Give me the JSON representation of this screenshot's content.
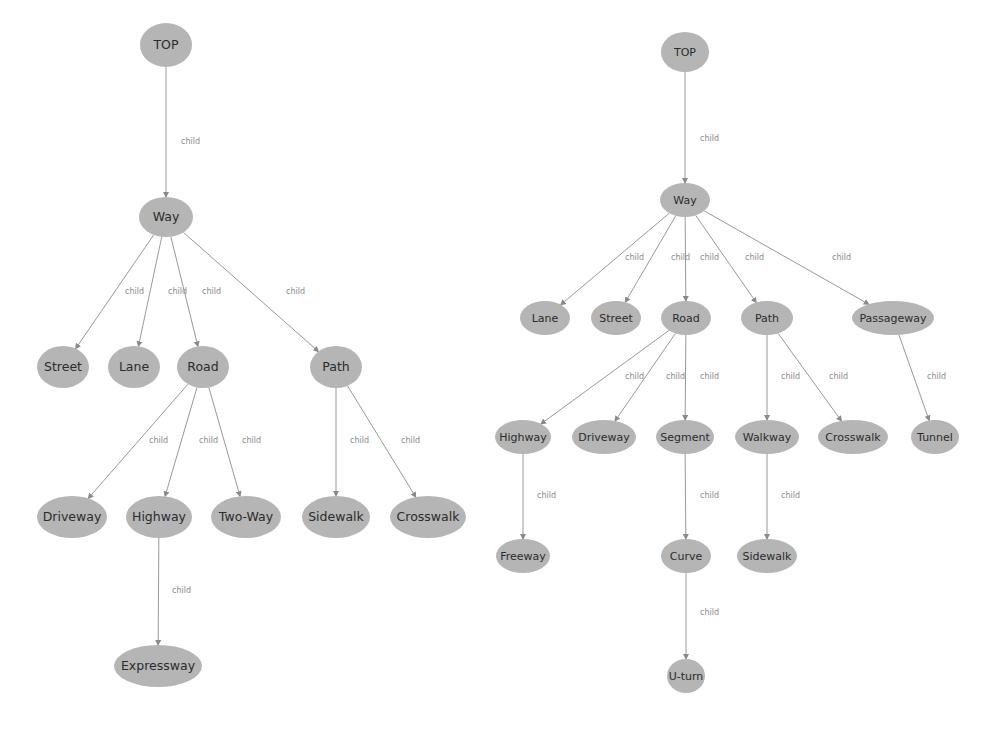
{
  "figure": {
    "type": "two-taxonomy-trees",
    "edge_label": "child",
    "node_fill": "#b5b5b5",
    "edge_color": "#9a9a9a",
    "text_color": "#2b2b2b",
    "edge_label_color": "#8a8a8a"
  },
  "left_tree": {
    "nodes": [
      {
        "id": "L_TOP",
        "label": "TOP",
        "x": 166,
        "y": 45,
        "rx": 26,
        "ry": 22
      },
      {
        "id": "L_Way",
        "label": "Way",
        "x": 166,
        "y": 217,
        "rx": 27,
        "ry": 20
      },
      {
        "id": "L_Street",
        "label": "Street",
        "x": 63,
        "y": 367,
        "rx": 26,
        "ry": 21
      },
      {
        "id": "L_Lane",
        "label": "Lane",
        "x": 134,
        "y": 367,
        "rx": 26,
        "ry": 21
      },
      {
        "id": "L_Road",
        "label": "Road",
        "x": 203,
        "y": 367,
        "rx": 26,
        "ry": 21
      },
      {
        "id": "L_Path",
        "label": "Path",
        "x": 336,
        "y": 367,
        "rx": 26,
        "ry": 21
      },
      {
        "id": "L_Driveway",
        "label": "Driveway",
        "x": 72,
        "y": 517,
        "rx": 35,
        "ry": 21
      },
      {
        "id": "L_Highway",
        "label": "Highway",
        "x": 159,
        "y": 517,
        "rx": 33,
        "ry": 21
      },
      {
        "id": "L_TwoWay",
        "label": "Two-Way",
        "x": 246,
        "y": 517,
        "rx": 35,
        "ry": 21
      },
      {
        "id": "L_Sidewalk",
        "label": "Sidewalk",
        "x": 336,
        "y": 517,
        "rx": 34,
        "ry": 21
      },
      {
        "id": "L_Crosswalk",
        "label": "Crosswalk",
        "x": 428,
        "y": 517,
        "rx": 38,
        "ry": 21
      },
      {
        "id": "L_Expressway",
        "label": "Expressway",
        "x": 158,
        "y": 666,
        "rx": 44,
        "ry": 21
      }
    ],
    "edges": [
      {
        "from": "L_TOP",
        "to": "L_Way",
        "label": "child",
        "lx": 181,
        "ly": 144
      },
      {
        "from": "L_Way",
        "to": "L_Street",
        "label": "child",
        "lx": 125,
        "ly": 294
      },
      {
        "from": "L_Way",
        "to": "L_Lane",
        "label": "child",
        "lx": 168,
        "ly": 294
      },
      {
        "from": "L_Way",
        "to": "L_Road",
        "label": "child",
        "lx": 202,
        "ly": 294
      },
      {
        "from": "L_Way",
        "to": "L_Path",
        "label": "child",
        "lx": 286,
        "ly": 294
      },
      {
        "from": "L_Road",
        "to": "L_Driveway",
        "label": "child",
        "lx": 149,
        "ly": 443
      },
      {
        "from": "L_Road",
        "to": "L_Highway",
        "label": "child",
        "lx": 199,
        "ly": 443
      },
      {
        "from": "L_Road",
        "to": "L_TwoWay",
        "label": "child",
        "lx": 242,
        "ly": 443
      },
      {
        "from": "L_Path",
        "to": "L_Sidewalk",
        "label": "child",
        "lx": 350,
        "ly": 443
      },
      {
        "from": "L_Path",
        "to": "L_Crosswalk",
        "label": "child",
        "lx": 401,
        "ly": 443
      },
      {
        "from": "L_Highway",
        "to": "L_Expressway",
        "label": "child",
        "lx": 172,
        "ly": 593
      }
    ]
  },
  "right_tree": {
    "nodes": [
      {
        "id": "R_TOP",
        "label": "TOP",
        "x": 685,
        "y": 52,
        "rx": 24,
        "ry": 20
      },
      {
        "id": "R_Way",
        "label": "Way",
        "x": 685,
        "y": 200,
        "rx": 25,
        "ry": 17
      },
      {
        "id": "R_Lane",
        "label": "Lane",
        "x": 545,
        "y": 318,
        "rx": 25,
        "ry": 17
      },
      {
        "id": "R_Street",
        "label": "Street",
        "x": 616,
        "y": 318,
        "rx": 25,
        "ry": 17
      },
      {
        "id": "R_Road",
        "label": "Road",
        "x": 686,
        "y": 318,
        "rx": 25,
        "ry": 17
      },
      {
        "id": "R_Path",
        "label": "Path",
        "x": 767,
        "y": 318,
        "rx": 26,
        "ry": 17
      },
      {
        "id": "R_Passageway",
        "label": "Passageway",
        "x": 893,
        "y": 318,
        "rx": 41,
        "ry": 17
      },
      {
        "id": "R_Highway",
        "label": "Highway",
        "x": 523,
        "y": 437,
        "rx": 28,
        "ry": 17
      },
      {
        "id": "R_Driveway",
        "label": "Driveway",
        "x": 604,
        "y": 437,
        "rx": 32,
        "ry": 17
      },
      {
        "id": "R_Segment",
        "label": "Segment",
        "x": 685,
        "y": 437,
        "rx": 29,
        "ry": 17
      },
      {
        "id": "R_Walkway",
        "label": "Walkway",
        "x": 767,
        "y": 437,
        "rx": 32,
        "ry": 17
      },
      {
        "id": "R_Crosswalk",
        "label": "Crosswalk",
        "x": 853,
        "y": 437,
        "rx": 35,
        "ry": 17
      },
      {
        "id": "R_Tunnel",
        "label": "Tunnel",
        "x": 935,
        "y": 437,
        "rx": 24,
        "ry": 17
      },
      {
        "id": "R_Freeway",
        "label": "Freeway",
        "x": 523,
        "y": 556,
        "rx": 27,
        "ry": 17
      },
      {
        "id": "R_Curve",
        "label": "Curve",
        "x": 686,
        "y": 556,
        "rx": 25,
        "ry": 17
      },
      {
        "id": "R_Sidewalk",
        "label": "Sidewalk",
        "x": 767,
        "y": 556,
        "rx": 30,
        "ry": 17
      },
      {
        "id": "R_Uturn",
        "label": "U-turn",
        "x": 686,
        "y": 676,
        "rx": 19,
        "ry": 17
      }
    ],
    "edges": [
      {
        "from": "R_TOP",
        "to": "R_Way",
        "label": "child",
        "lx": 700,
        "ly": 141
      },
      {
        "from": "R_Way",
        "to": "R_Lane",
        "label": "child",
        "lx": 625,
        "ly": 260
      },
      {
        "from": "R_Way",
        "to": "R_Street",
        "label": "child",
        "lx": 671,
        "ly": 260
      },
      {
        "from": "R_Way",
        "to": "R_Road",
        "label": "child",
        "lx": 700,
        "ly": 260
      },
      {
        "from": "R_Way",
        "to": "R_Path",
        "label": "child",
        "lx": 745,
        "ly": 260
      },
      {
        "from": "R_Way",
        "to": "R_Passageway",
        "label": "child",
        "lx": 832,
        "ly": 260
      },
      {
        "from": "R_Road",
        "to": "R_Highway",
        "label": "child",
        "lx": 625,
        "ly": 379
      },
      {
        "from": "R_Road",
        "to": "R_Driveway",
        "label": "child",
        "lx": 666,
        "ly": 379
      },
      {
        "from": "R_Road",
        "to": "R_Segment",
        "label": "child",
        "lx": 700,
        "ly": 379
      },
      {
        "from": "R_Path",
        "to": "R_Walkway",
        "label": "child",
        "lx": 781,
        "ly": 379
      },
      {
        "from": "R_Path",
        "to": "R_Crosswalk",
        "label": "child",
        "lx": 829,
        "ly": 379
      },
      {
        "from": "R_Passageway",
        "to": "R_Tunnel",
        "label": "child",
        "lx": 927,
        "ly": 379
      },
      {
        "from": "R_Highway",
        "to": "R_Freeway",
        "label": "child",
        "lx": 537,
        "ly": 498
      },
      {
        "from": "R_Segment",
        "to": "R_Curve",
        "label": "child",
        "lx": 700,
        "ly": 498
      },
      {
        "from": "R_Walkway",
        "to": "R_Sidewalk",
        "label": "child",
        "lx": 781,
        "ly": 498
      },
      {
        "from": "R_Curve",
        "to": "R_Uturn",
        "label": "child",
        "lx": 700,
        "ly": 615
      }
    ]
  }
}
